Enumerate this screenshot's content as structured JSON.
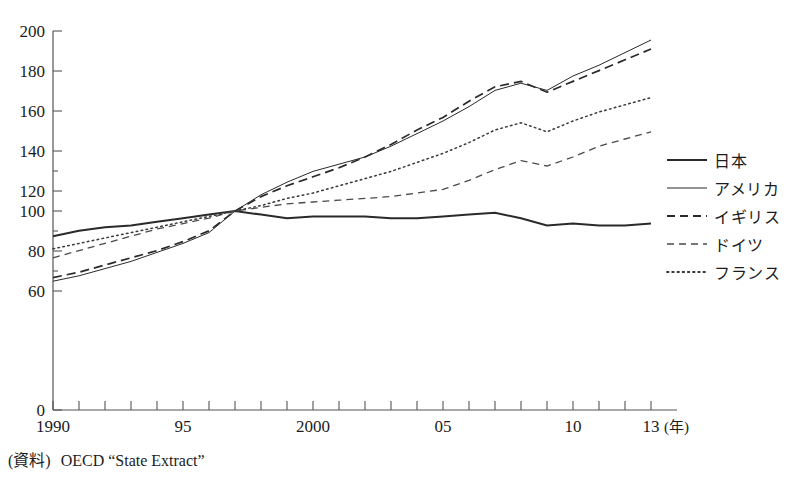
{
  "chart_data": {
    "type": "line",
    "title": "",
    "xlabel": "(年)",
    "ylabel": "",
    "xlim": [
      1990,
      2013
    ],
    "ylim": [
      0,
      200
    ],
    "y_axis_break": true,
    "y_ticks": [
      0,
      60,
      80,
      100,
      120,
      140,
      160,
      180,
      200
    ],
    "y_tick_labels": [
      "0",
      "60",
      "80",
      "100",
      "120",
      "140",
      "160",
      "180",
      "200"
    ],
    "x_ticks": [
      1990,
      1995,
      2000,
      2005,
      2010,
      2013
    ],
    "x_tick_labels": [
      "1990",
      "95",
      "2000",
      "05",
      "10",
      "13"
    ],
    "x_minor_ticks_every": 1,
    "grid": false,
    "legend_position": "right",
    "x": [
      1990,
      1991,
      1992,
      1993,
      1994,
      1995,
      1996,
      1997,
      1998,
      1999,
      2000,
      2001,
      2002,
      2003,
      2004,
      2005,
      2006,
      2007,
      2008,
      2009,
      2010,
      2011,
      2012,
      2013
    ],
    "series": [
      {
        "name": "日本",
        "style": "solid-thick",
        "values": [
          86,
          89,
          91,
          92,
          94,
          96,
          98,
          100,
          98,
          96,
          97,
          97,
          97,
          96,
          96,
          97,
          98,
          99,
          96,
          92,
          93,
          92,
          92,
          93
        ]
      },
      {
        "name": "アメリカ",
        "style": "solid-thin",
        "values": [
          61,
          64,
          68,
          72,
          77,
          82,
          88,
          100,
          109,
          116,
          122,
          126,
          130,
          136,
          143,
          150,
          158,
          167,
          171,
          167,
          175,
          181,
          188,
          195
        ]
      },
      {
        "name": "イギリス",
        "style": "dashed-long",
        "values": [
          63,
          66,
          70,
          74,
          78,
          83,
          89,
          100,
          108,
          114,
          119,
          124,
          130,
          137,
          145,
          152,
          161,
          169,
          172,
          166,
          172,
          178,
          184,
          190
        ]
      },
      {
        "name": "ドイツ",
        "style": "dashed-short",
        "values": [
          74,
          78,
          82,
          86,
          90,
          93,
          96,
          100,
          102,
          104,
          105,
          106,
          107,
          108,
          110,
          112,
          117,
          123,
          128,
          125,
          130,
          136,
          140,
          144
        ]
      },
      {
        "name": "フランス",
        "style": "dotted",
        "values": [
          79,
          82,
          85,
          88,
          91,
          94,
          97,
          100,
          103,
          107,
          110,
          114,
          118,
          122,
          127,
          132,
          138,
          145,
          149,
          144,
          150,
          155,
          159,
          163
        ]
      }
    ]
  },
  "axis": {
    "x_unit_label": "(年)",
    "x_tick_labels": [
      "1990",
      "95",
      "2000",
      "05",
      "10",
      "13"
    ],
    "y_tick_labels": [
      "200",
      "180",
      "160",
      "140",
      "120",
      "100",
      "80",
      "60",
      "0"
    ]
  },
  "legend": {
    "items": [
      {
        "label": "日本",
        "style": "solid-thick"
      },
      {
        "label": "アメリカ",
        "style": "solid-thin"
      },
      {
        "label": "イギリス",
        "style": "dashed-long"
      },
      {
        "label": "ドイツ",
        "style": "dashed-short"
      },
      {
        "label": "フランス",
        "style": "dotted"
      }
    ]
  },
  "footer": {
    "source_label": "(資料)",
    "source_text": "OECD “State Extract”"
  },
  "title": {
    "text": ""
  }
}
